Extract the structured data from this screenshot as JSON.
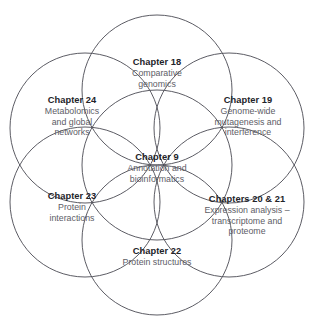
{
  "figure": {
    "type": "venn-diagram",
    "circle_count": 7,
    "stroke_color": "#4a4a52",
    "title_color": "#232329",
    "body_color": "#5d5d66",
    "background": "#ffffff"
  },
  "nodes": [
    {
      "id": "ch18",
      "position": "top",
      "title": "Chapter 18",
      "lines": [
        "Comparative",
        "genomics"
      ]
    },
    {
      "id": "ch24",
      "position": "upper-left",
      "title": "Chapter 24",
      "lines": [
        "Metabolomics",
        "and global",
        "networks"
      ]
    },
    {
      "id": "ch19",
      "position": "upper-right",
      "title": "Chapter 19",
      "lines": [
        "Genome-wide",
        "mutagenesis and",
        "interference"
      ]
    },
    {
      "id": "ch9",
      "position": "center",
      "title": "Chapter 9",
      "lines": [
        "Annotation and",
        "bioinformatics"
      ]
    },
    {
      "id": "ch23",
      "position": "lower-left",
      "title": "Chapter 23",
      "lines": [
        "Protein",
        "interactions"
      ]
    },
    {
      "id": "ch2021",
      "position": "lower-right",
      "title": "Chapters 20 & 21",
      "lines": [
        "Expression analysis –",
        "transcriptome and",
        "proteome"
      ]
    },
    {
      "id": "ch22",
      "position": "bottom",
      "title": "Chapter 22",
      "lines": [
        "Protein structures"
      ]
    }
  ],
  "geometry": {
    "radius": 75,
    "circles": [
      {
        "id": "circle-center",
        "cx": 157,
        "cy": 165
      },
      {
        "id": "circle-top",
        "cx": 157,
        "cy": 90
      },
      {
        "id": "circle-upper-left",
        "cx": 85,
        "cy": 128
      },
      {
        "id": "circle-upper-right",
        "cx": 229,
        "cy": 128
      },
      {
        "id": "circle-lower-left",
        "cx": 85,
        "cy": 202
      },
      {
        "id": "circle-lower-right",
        "cx": 229,
        "cy": 202
      },
      {
        "id": "circle-bottom",
        "cx": 157,
        "cy": 240
      }
    ]
  }
}
